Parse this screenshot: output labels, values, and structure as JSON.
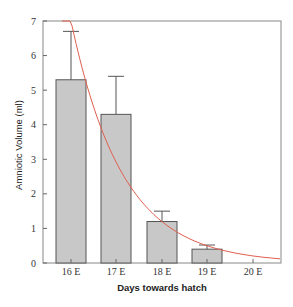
{
  "chart_data": {
    "type": "bar",
    "title": "",
    "xlabel": "Days towards hatch",
    "ylabel": "Amniotic Volume (ml)",
    "categories": [
      "16 E",
      "17 E",
      "18 E",
      "19 E",
      "20 E"
    ],
    "values": [
      5.3,
      4.3,
      1.2,
      0.4,
      null
    ],
    "error_upper": [
      6.7,
      5.4,
      1.5,
      0.52,
      null
    ],
    "ylim": [
      0,
      7
    ],
    "yticks": [
      0,
      1,
      2,
      3,
      4,
      5,
      6,
      7
    ],
    "grid": false,
    "legend": null,
    "bar_color": "#c8c8c8",
    "bar_edge_color": "#555555",
    "fit_curve": {
      "type": "exponential decay",
      "color": "#e06050",
      "points": [
        {
          "x": "16 E",
          "y": 7.0
        },
        {
          "x": "17 E",
          "y": 2.1
        },
        {
          "x": "18 E",
          "y": 1.2
        },
        {
          "x": "19 E",
          "y": 0.5
        },
        {
          "x": "20 E",
          "y": 0.2
        }
      ]
    }
  }
}
